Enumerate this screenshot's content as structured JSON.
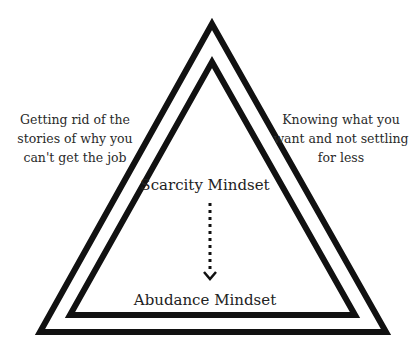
{
  "diagram": {
    "left_label": "Getting rid of the stories of why you can't get the job",
    "right_label": "Knowing what you want and not settling for less",
    "top_center_label": "Scarcity Mindset",
    "bottom_center_label": "Abudance Mindset",
    "arrow": {
      "style": "dotted",
      "direction": "down",
      "from": "Scarcity Mindset",
      "to": "Abudance Mindset"
    },
    "shapes": {
      "outer_triangle": {
        "apex": [
          212,
          24
        ],
        "bottom_left": [
          40,
          332
        ],
        "bottom_right": [
          386,
          332
        ]
      },
      "inner_triangle": {
        "apex": [
          212,
          62
        ],
        "bottom_left": [
          70,
          315
        ],
        "bottom_right": [
          355,
          315
        ]
      }
    },
    "colors": {
      "stroke": "#111111",
      "text": "#2a2a2a",
      "background": "#ffffff"
    }
  }
}
